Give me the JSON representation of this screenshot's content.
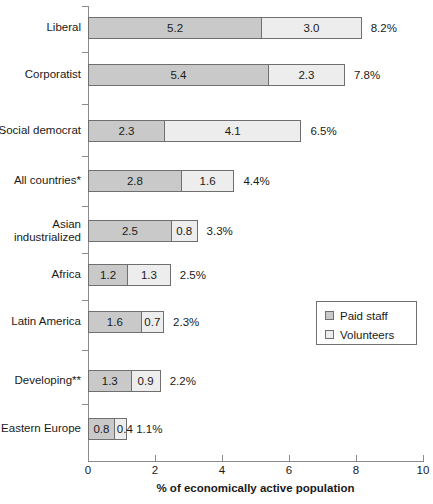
{
  "chart_data": {
    "type": "bar",
    "orientation": "horizontal",
    "stacked": true,
    "title": "",
    "xlabel": "% of economically active population",
    "ylabel": "",
    "xlim": [
      0,
      10
    ],
    "xticks": [
      0,
      2,
      4,
      6,
      8,
      10
    ],
    "xtick_labels": [
      "0",
      "2",
      "4",
      "6",
      "8",
      "10"
    ],
    "grid": false,
    "legend_position": "middle-right",
    "categories": [
      "Liberal",
      "Corporatist",
      "Social democrat",
      "All countries*",
      "Asian\nindustrialized",
      "Africa",
      "Latin America",
      "Developing**",
      "Eastern Europe"
    ],
    "series": [
      {
        "name": "Paid staff",
        "color": "#c9c9c9",
        "values": [
          5.2,
          5.4,
          2.3,
          2.8,
          2.5,
          1.2,
          1.6,
          1.3,
          0.8
        ]
      },
      {
        "name": "Volunteers",
        "color": "#ededed",
        "values": [
          3.0,
          2.3,
          4.1,
          1.6,
          0.8,
          1.3,
          0.7,
          0.9,
          0.4
        ]
      }
    ],
    "totals": [
      8.2,
      7.8,
      6.5,
      4.4,
      3.3,
      2.5,
      2.3,
      2.2,
      1.1
    ],
    "total_labels": [
      "8.2%",
      "7.8%",
      "6.5%",
      "4.4%",
      "3.3%",
      "2.5%",
      "2.3%",
      "2.2%",
      "1.1%"
    ],
    "value_labels": {
      "paid": [
        "5.2",
        "5.4",
        "2.3",
        "2.8",
        "2.5",
        "1.2",
        "1.6",
        "1.3",
        "0.8"
      ],
      "volunteers": [
        "3.0",
        "2.3",
        "4.1",
        "1.6",
        "0.8",
        "1.3",
        "0.7",
        "0.9",
        "0.4"
      ]
    }
  },
  "legend": {
    "items": [
      {
        "label": "Paid staff",
        "color": "#c9c9c9"
      },
      {
        "label": "Volunteers",
        "color": "#ededed"
      }
    ]
  },
  "axis": {
    "x_title": "% of economically active population"
  }
}
